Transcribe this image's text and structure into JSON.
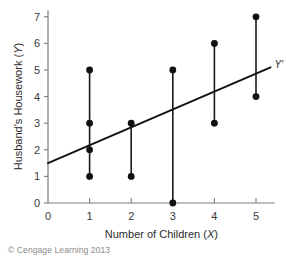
{
  "figure": {
    "credit": "© Cengage Learning 2013",
    "line_label": "Y′"
  },
  "chart_data": {
    "type": "scatter",
    "title": "",
    "xlabel": "Number of Children (X)",
    "ylabel": "Husband's Housework (Y)",
    "xlabel_text": "Number of Children",
    "xlabel_var": "X",
    "ylabel_text": "Husband's Housework",
    "ylabel_var": "Y",
    "xlim": [
      0,
      5.45
    ],
    "ylim": [
      0,
      7.25
    ],
    "xticks": [
      0,
      1,
      2,
      3,
      4,
      5
    ],
    "yticks": [
      0,
      1,
      2,
      3,
      4,
      5,
      6,
      7
    ],
    "xtick_labels": [
      "0",
      "1",
      "2",
      "3",
      "4",
      "5"
    ],
    "ytick_labels": [
      "0",
      "1",
      "2",
      "3",
      "4",
      "5",
      "6",
      "7"
    ],
    "grid": false,
    "legend": false,
    "point_color": "#111111",
    "line_color": "#111111",
    "axis_color": "#7d7d7d",
    "points": [
      {
        "x": 1,
        "y": 1
      },
      {
        "x": 1,
        "y": 2
      },
      {
        "x": 1,
        "y": 3
      },
      {
        "x": 1,
        "y": 5
      },
      {
        "x": 2,
        "y": 1
      },
      {
        "x": 2,
        "y": 3
      },
      {
        "x": 3,
        "y": 0
      },
      {
        "x": 3,
        "y": 5
      },
      {
        "x": 4,
        "y": 3
      },
      {
        "x": 4,
        "y": 6
      },
      {
        "x": 5,
        "y": 4
      },
      {
        "x": 5,
        "y": 7
      }
    ],
    "connectors": [
      {
        "x": 1,
        "y_min": 1,
        "y_max": 5
      },
      {
        "x": 2,
        "y_min": 1,
        "y_max": 3
      },
      {
        "x": 3,
        "y_min": 0,
        "y_max": 5
      },
      {
        "x": 4,
        "y_min": 3,
        "y_max": 6
      },
      {
        "x": 5,
        "y_min": 4,
        "y_max": 7
      }
    ],
    "regression_line": {
      "label": "Y′",
      "x0": 0,
      "y0": 1.5,
      "x1": 5.35,
      "y1": 5.1
    }
  }
}
